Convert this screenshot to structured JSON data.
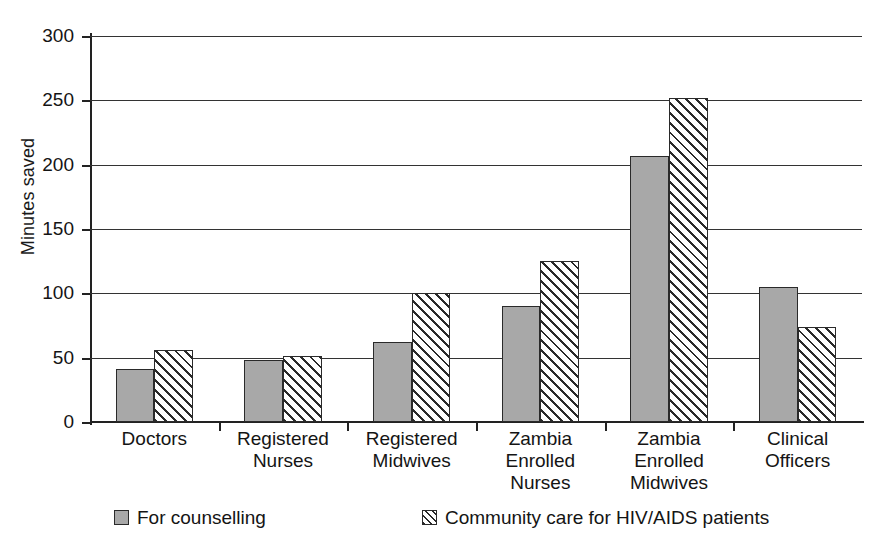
{
  "chart_data": {
    "type": "bar",
    "title": "",
    "xlabel": "",
    "ylabel": "Minutes saved",
    "ylim": [
      0,
      300
    ],
    "ytick_step": 50,
    "yticks": [
      "0",
      "50",
      "100",
      "150",
      "200",
      "250",
      "300"
    ],
    "grid": true,
    "legend_position": "bottom",
    "categories": [
      "Doctors",
      "Registered Nurses",
      "Registered Midwives",
      "Zambia Enrolled Nurses",
      "Zambia Enrolled Midwives",
      "Clinical Officers"
    ],
    "category_lines": [
      [
        "Doctors"
      ],
      [
        "Registered",
        "Nurses"
      ],
      [
        "Registered",
        "Midwives"
      ],
      [
        "Zambia",
        "Enrolled",
        "Nurses"
      ],
      [
        "Zambia",
        "Enrolled",
        "Midwives"
      ],
      [
        "Clinical",
        "Officers"
      ]
    ],
    "series": [
      {
        "name": "For counselling",
        "fill": "solid-gray",
        "color": "#a8a8a8",
        "values": [
          41,
          48,
          62,
          90,
          207,
          105
        ]
      },
      {
        "name": "Community care for HIV/AIDS patients",
        "fill": "diagonal-hatch",
        "color": "#ffffff",
        "values": [
          56,
          51,
          100,
          125,
          252,
          74
        ]
      }
    ]
  },
  "legend": {
    "items": [
      {
        "label": "For counselling",
        "swatch": "solid-gray"
      },
      {
        "label": "Community care for HIV/AIDS patients",
        "swatch": "diagonal-hatch"
      }
    ]
  },
  "axis": {
    "y_title": "Minutes saved"
  },
  "colors": {
    "series_1_fill": "#a8a8a8",
    "series_2_fill": "#ffffff",
    "hatch_stroke": "#2a2a2a",
    "axis": "#222222",
    "grid": "#333333",
    "text": "#141414",
    "background": "#ffffff"
  }
}
